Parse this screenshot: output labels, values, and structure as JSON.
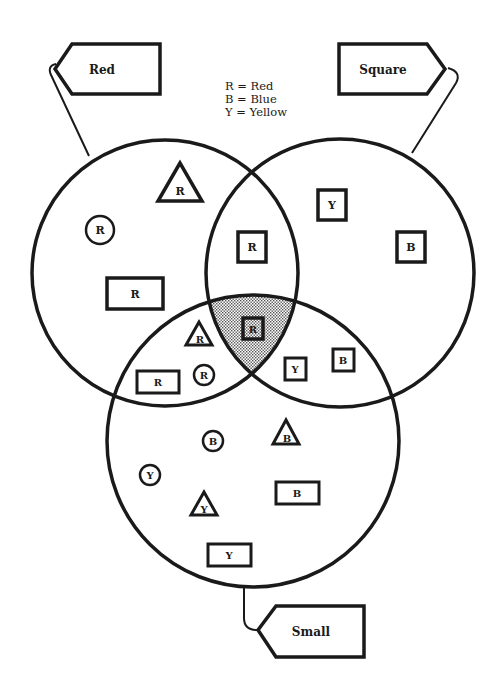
{
  "diagram": {
    "type": "venn",
    "legend": [
      {
        "key": "R",
        "value": "Red",
        "text": "R = Red"
      },
      {
        "key": "B",
        "value": "Blue",
        "text": "B = Blue"
      },
      {
        "key": "Y",
        "value": "Yellow",
        "text": "Y = Yellow"
      }
    ],
    "sets": [
      {
        "id": "red",
        "tag_label": "Red",
        "cx": 165,
        "cy": 273,
        "r": 133
      },
      {
        "id": "square",
        "tag_label": "Square",
        "cx": 340,
        "cy": 273,
        "r": 134
      },
      {
        "id": "small",
        "tag_label": "Small",
        "cx": 253,
        "cy": 441,
        "r": 146
      }
    ],
    "highlighted_region": "red ∩ square ∩ small",
    "items": [
      {
        "shape": "triangle",
        "size": "large",
        "letter": "R",
        "x": 180,
        "y": 188,
        "region": "red only"
      },
      {
        "shape": "circle",
        "size": "large",
        "letter": "R",
        "x": 100,
        "y": 230,
        "region": "red only"
      },
      {
        "shape": "rectangle",
        "size": "large",
        "letter": "R",
        "x": 135,
        "y": 294,
        "region": "red only"
      },
      {
        "shape": "square",
        "size": "large",
        "letter": "R",
        "x": 252,
        "y": 247,
        "region": "red ∩ square"
      },
      {
        "shape": "square",
        "size": "large",
        "letter": "Y",
        "x": 332,
        "y": 205,
        "region": "square only"
      },
      {
        "shape": "square",
        "size": "large",
        "letter": "B",
        "x": 411,
        "y": 247,
        "region": "square only"
      },
      {
        "shape": "square",
        "size": "small",
        "letter": "R",
        "x": 253,
        "y": 329,
        "region": "red ∩ square ∩ small"
      },
      {
        "shape": "triangle",
        "size": "small",
        "letter": "R",
        "x": 199,
        "y": 335,
        "region": "red ∩ small"
      },
      {
        "shape": "rectangle",
        "size": "small",
        "letter": "R",
        "x": 158,
        "y": 382,
        "region": "red ∩ small"
      },
      {
        "shape": "circle",
        "size": "small",
        "letter": "R",
        "x": 204,
        "y": 375,
        "region": "red ∩ small"
      },
      {
        "shape": "square",
        "size": "small",
        "letter": "Y",
        "x": 295,
        "y": 369,
        "region": "square ∩ small"
      },
      {
        "shape": "square",
        "size": "small",
        "letter": "B",
        "x": 343,
        "y": 360,
        "region": "square ∩ small"
      },
      {
        "shape": "circle",
        "size": "small",
        "letter": "B",
        "x": 213,
        "y": 441,
        "region": "small only"
      },
      {
        "shape": "triangle",
        "size": "small",
        "letter": "B",
        "x": 286,
        "y": 433,
        "region": "small only"
      },
      {
        "shape": "circle",
        "size": "small",
        "letter": "Y",
        "x": 150,
        "y": 475,
        "region": "small only"
      },
      {
        "shape": "triangle",
        "size": "small",
        "letter": "Y",
        "x": 204,
        "y": 505,
        "region": "small only"
      },
      {
        "shape": "rectangle",
        "size": "small",
        "letter": "B",
        "x": 297,
        "y": 493,
        "region": "small only"
      },
      {
        "shape": "rectangle",
        "size": "small",
        "letter": "Y",
        "x": 229,
        "y": 555,
        "region": "small only"
      }
    ]
  }
}
